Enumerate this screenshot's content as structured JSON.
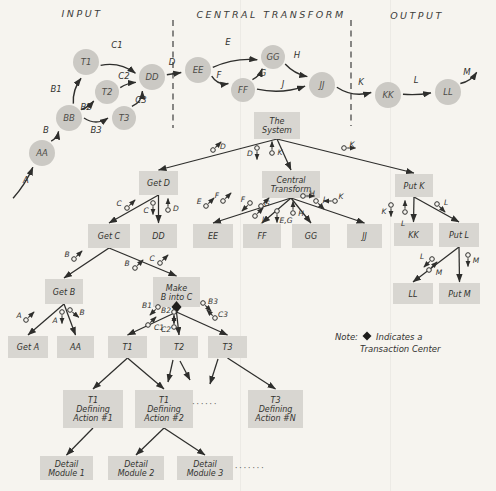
{
  "diagram": {
    "background_color": "#f6f4ef",
    "ink_color": "#2e2e2c",
    "node_fill": "#cbc9c4",
    "module_fill": "#d8d6d1",
    "sections": [
      {
        "label": "INPUT",
        "x": 82,
        "y": 17
      },
      {
        "label": "CENTRAL TRANSFORM",
        "x": 271,
        "y": 18
      },
      {
        "label": "OUTPUT",
        "x": 417,
        "y": 19
      }
    ],
    "dividers": [
      {
        "x": 173,
        "y1": 20,
        "y2": 128
      },
      {
        "x": 351,
        "y1": 20,
        "y2": 126
      }
    ],
    "folds": [
      {
        "x": 240.5
      },
      {
        "x": 390.5
      }
    ],
    "flow": {
      "nodes": [
        {
          "id": "AA",
          "label": "AA",
          "x": 42,
          "y": 153,
          "r": 13
        },
        {
          "id": "BB",
          "label": "BB",
          "x": 69,
          "y": 118,
          "r": 13
        },
        {
          "id": "T1",
          "label": "T1",
          "x": 86,
          "y": 62,
          "r": 13
        },
        {
          "id": "T2",
          "label": "T2",
          "x": 107,
          "y": 92,
          "r": 12
        },
        {
          "id": "T3",
          "label": "T3",
          "x": 124,
          "y": 118,
          "r": 12
        },
        {
          "id": "DD",
          "label": "DD",
          "x": 152,
          "y": 77,
          "r": 13
        },
        {
          "id": "EE",
          "label": "EE",
          "x": 198,
          "y": 70,
          "r": 13
        },
        {
          "id": "FF",
          "label": "FF",
          "x": 243,
          "y": 90,
          "r": 12
        },
        {
          "id": "GG",
          "label": "GG",
          "x": 273,
          "y": 57,
          "r": 12
        },
        {
          "id": "JJ",
          "label": "JJ",
          "x": 322,
          "y": 85,
          "r": 13
        },
        {
          "id": "KK",
          "label": "KK",
          "x": 388,
          "y": 95,
          "r": 13
        },
        {
          "id": "LL",
          "label": "LL",
          "x": 448,
          "y": 92,
          "r": 13
        }
      ],
      "edges": [
        {
          "x1": 12,
          "y1": 200,
          "to": "AA",
          "label": "A",
          "lx": 26,
          "ly": 183,
          "bend": 3
        },
        {
          "from": "AA",
          "to": "BB",
          "label": "B",
          "lx": 46,
          "ly": 133,
          "bend": 3
        },
        {
          "from": "BB",
          "to": "T1",
          "label": "B1",
          "lx": 56,
          "ly": 92,
          "bend": -5
        },
        {
          "from": "BB",
          "to": "T2",
          "label": "B2",
          "lx": 86,
          "ly": 110,
          "bend": 2
        },
        {
          "from": "BB",
          "to": "T3",
          "label": "B3",
          "lx": 96,
          "ly": 133,
          "bend": 8
        },
        {
          "from": "T1",
          "to": "DD",
          "label": "C1",
          "lx": 117,
          "ly": 48,
          "bend": -8
        },
        {
          "from": "T2",
          "to": "DD",
          "label": "C2",
          "lx": 124,
          "ly": 79,
          "bend": -2
        },
        {
          "from": "T3",
          "to": "DD",
          "label": "C3",
          "lx": 141,
          "ly": 103,
          "bend": 6
        },
        {
          "from": "DD",
          "to": "EE",
          "label": "D",
          "lx": 172,
          "ly": 65,
          "bend": 0
        },
        {
          "from": "EE",
          "to": "GG",
          "label": "E",
          "lx": 228,
          "ly": 45,
          "bend": -6
        },
        {
          "from": "EE",
          "to": "FF",
          "label": "F",
          "lx": 219,
          "ly": 78,
          "bend": 6
        },
        {
          "from": "FF",
          "to": "GG",
          "label": "G",
          "lx": 263,
          "ly": 76,
          "bend": 3
        },
        {
          "from": "GG",
          "to": "JJ",
          "label": "H",
          "lx": 297,
          "ly": 58,
          "bend": 4
        },
        {
          "from": "FF",
          "to": "JJ",
          "label": "J",
          "lx": 283,
          "ly": 87,
          "bend": 7
        },
        {
          "from": "JJ",
          "to": "KK",
          "label": "K",
          "lx": 361,
          "ly": 85,
          "bend": 8
        },
        {
          "from": "KK",
          "to": "LL",
          "label": "L",
          "lx": 416,
          "ly": 83,
          "bend": 2
        },
        {
          "from": "LL",
          "x2": 480,
          "y2": 70,
          "label": "M",
          "lx": 467,
          "ly": 75,
          "bend": 4
        }
      ]
    },
    "structure": {
      "modules": [
        {
          "id": "system",
          "label": [
            "The",
            "System"
          ],
          "x": 254,
          "y": 112,
          "w": 46,
          "h": 27
        },
        {
          "id": "getD",
          "label": [
            "Get D"
          ],
          "x": 139,
          "y": 171,
          "w": 39,
          "h": 24
        },
        {
          "id": "central",
          "label": [
            "Central",
            "Transform"
          ],
          "x": 262,
          "y": 171,
          "w": 58,
          "h": 27
        },
        {
          "id": "putK",
          "label": [
            "Put K"
          ],
          "x": 395,
          "y": 174,
          "w": 38,
          "h": 23
        },
        {
          "id": "getC",
          "label": [
            "Get C"
          ],
          "x": 88,
          "y": 224,
          "w": 42,
          "h": 24
        },
        {
          "id": "dd",
          "label": [
            "DD"
          ],
          "x": 140,
          "y": 224,
          "w": 37,
          "h": 24
        },
        {
          "id": "ee",
          "label": [
            "EE"
          ],
          "x": 193,
          "y": 224,
          "w": 40,
          "h": 24
        },
        {
          "id": "ff",
          "label": [
            "FF"
          ],
          "x": 243,
          "y": 224,
          "w": 38,
          "h": 24
        },
        {
          "id": "gg",
          "label": [
            "GG"
          ],
          "x": 292,
          "y": 224,
          "w": 38,
          "h": 24
        },
        {
          "id": "jj",
          "label": [
            "JJ"
          ],
          "x": 347,
          "y": 224,
          "w": 35,
          "h": 24
        },
        {
          "id": "kk",
          "label": [
            "KK"
          ],
          "x": 394,
          "y": 223,
          "w": 39,
          "h": 23
        },
        {
          "id": "putL",
          "label": [
            "Put L"
          ],
          "x": 439,
          "y": 223,
          "w": 40,
          "h": 24
        },
        {
          "id": "getB",
          "label": [
            "Get B"
          ],
          "x": 45,
          "y": 279,
          "w": 38,
          "h": 25
        },
        {
          "id": "make",
          "label": [
            "Make",
            "B into C"
          ],
          "x": 153,
          "y": 277,
          "w": 47,
          "h": 30,
          "diamond": true
        },
        {
          "id": "ll",
          "label": [
            "LL"
          ],
          "x": 393,
          "y": 283,
          "w": 40,
          "h": 21
        },
        {
          "id": "putM",
          "label": [
            "Put M"
          ],
          "x": 439,
          "y": 283,
          "w": 41,
          "h": 21
        },
        {
          "id": "getA",
          "label": [
            "Get A"
          ],
          "x": 8,
          "y": 336,
          "w": 40,
          "h": 22
        },
        {
          "id": "aa",
          "label": [
            "AA"
          ],
          "x": 57,
          "y": 336,
          "w": 37,
          "h": 22
        },
        {
          "id": "t1",
          "label": [
            "T1"
          ],
          "x": 108,
          "y": 336,
          "w": 39,
          "h": 22
        },
        {
          "id": "t2",
          "label": [
            "T2"
          ],
          "x": 160,
          "y": 336,
          "w": 38,
          "h": 22
        },
        {
          "id": "t3",
          "label": [
            "T3"
          ],
          "x": 208,
          "y": 336,
          "w": 39,
          "h": 22
        },
        {
          "id": "act1",
          "label": [
            "T1",
            "Defining",
            "Action #1"
          ],
          "x": 63,
          "y": 390,
          "w": 60,
          "h": 38
        },
        {
          "id": "act2",
          "label": [
            "T1",
            "Defining",
            "Action #2"
          ],
          "x": 135,
          "y": 390,
          "w": 58,
          "h": 38
        },
        {
          "id": "actN",
          "label": [
            "T3",
            "Defining",
            "Action #N"
          ],
          "x": 248,
          "y": 390,
          "w": 55,
          "h": 38
        },
        {
          "id": "det1",
          "label": [
            "Detail",
            "Module 1"
          ],
          "x": 40,
          "y": 456,
          "w": 53,
          "h": 24
        },
        {
          "id": "det2",
          "label": [
            "Detail",
            "Module 2"
          ],
          "x": 108,
          "y": 456,
          "w": 56,
          "h": 24
        },
        {
          "id": "det3",
          "label": [
            "Detail",
            "Module 3"
          ],
          "x": 177,
          "y": 456,
          "w": 56,
          "h": 24
        }
      ],
      "links": [
        {
          "from": "system",
          "to": "getD"
        },
        {
          "from": "system",
          "to": "central"
        },
        {
          "from": "system",
          "to": "putK"
        },
        {
          "from": "getD",
          "to": "getC"
        },
        {
          "from": "getD",
          "to": "dd"
        },
        {
          "from": "central",
          "to": "ee"
        },
        {
          "from": "central",
          "to": "ff"
        },
        {
          "from": "central",
          "to": "gg"
        },
        {
          "from": "central",
          "to": "jj"
        },
        {
          "from": "putK",
          "to": "kk"
        },
        {
          "from": "putK",
          "to": "putL"
        },
        {
          "from": "getC",
          "to": "getB"
        },
        {
          "from": "getC",
          "to": "make"
        },
        {
          "from": "getB",
          "to": "getA"
        },
        {
          "from": "getB",
          "to": "aa"
        },
        {
          "from": "make",
          "to": "t1"
        },
        {
          "from": "make",
          "to": "t2"
        },
        {
          "from": "make",
          "to": "t3"
        },
        {
          "from": "putL",
          "to": "ll"
        },
        {
          "from": "putL",
          "to": "putM"
        },
        {
          "from": "t1",
          "to": "act1"
        },
        {
          "from": "t1",
          "to": "act2"
        },
        {
          "from": "t3",
          "to": "actN"
        },
        {
          "from": "act1",
          "to": "det1"
        },
        {
          "from": "act2",
          "to": "det2"
        },
        {
          "from": "act2",
          "to": "det3"
        }
      ],
      "stubs": [
        {
          "x1": 173,
          "y1": 360,
          "x2": 168,
          "y2": 382
        },
        {
          "x1": 180,
          "y1": 361,
          "x2": 190,
          "y2": 380
        },
        {
          "x1": 218,
          "y1": 359,
          "x2": 210,
          "y2": 384
        }
      ],
      "couples": [
        {
          "l": "D",
          "cx": 213,
          "cy": 150,
          "a": 315,
          "lx": 223,
          "ly": 146
        },
        {
          "l": "D",
          "cx": 257,
          "cy": 148,
          "a": 90,
          "lx": 250,
          "ly": 153
        },
        {
          "l": "K",
          "cx": 272,
          "cy": 153,
          "a": 270,
          "lx": 280,
          "ly": 152
        },
        {
          "l": "K",
          "cx": 344,
          "cy": 148,
          "a": 0,
          "lx": 352,
          "ly": 144
        },
        {
          "l": "C",
          "cx": 127,
          "cy": 208,
          "a": 315,
          "lx": 119,
          "ly": 203
        },
        {
          "l": "C",
          "cx": 153,
          "cy": 203,
          "a": 90,
          "lx": 146,
          "ly": 210
        },
        {
          "l": "D",
          "cx": 168,
          "cy": 210,
          "a": 270,
          "lx": 176,
          "ly": 208
        },
        {
          "l": "E",
          "cx": 206,
          "cy": 206,
          "a": 315,
          "lx": 199,
          "ly": 201
        },
        {
          "l": "F",
          "cx": 223,
          "cy": 201,
          "a": 315,
          "lx": 217,
          "ly": 195
        },
        {
          "l": "F",
          "cx": 250,
          "cy": 203,
          "a": 135,
          "lx": 243,
          "ly": 199
        },
        {
          "l": "G",
          "cx": 261,
          "cy": 206,
          "a": 315,
          "lx": 267,
          "ly": 203
        },
        {
          "l": "J",
          "cx": 255,
          "cy": 216,
          "a": 315,
          "lx": 263,
          "ly": 219
        },
        {
          "l": "E,G",
          "cx": 277,
          "cy": 211,
          "a": 90,
          "lx": 286,
          "ly": 220
        },
        {
          "l": "H",
          "cx": 293,
          "cy": 213,
          "a": 270,
          "lx": 301,
          "ly": 213
        },
        {
          "l": "H",
          "cx": 303,
          "cy": 196,
          "a": 0,
          "lx": 312,
          "ly": 193
        },
        {
          "l": "J",
          "cx": 316,
          "cy": 201,
          "a": 45,
          "lx": 324,
          "ly": 199
        },
        {
          "l": "K",
          "cx": 335,
          "cy": 201,
          "a": 180,
          "lx": 341,
          "ly": 196
        },
        {
          "l": "K",
          "cx": 391,
          "cy": 205,
          "a": 90,
          "lx": 384,
          "ly": 211
        },
        {
          "l": "L",
          "cx": 405,
          "cy": 212,
          "a": 270,
          "lx": 403,
          "ly": 223
        },
        {
          "l": "L",
          "cx": 437,
          "cy": 204,
          "a": 45,
          "lx": 446,
          "ly": 202
        },
        {
          "l": "B",
          "cx": 74,
          "cy": 259,
          "a": 315,
          "lx": 67,
          "ly": 254
        },
        {
          "l": "B",
          "cx": 135,
          "cy": 268,
          "a": 315,
          "lx": 127,
          "ly": 263
        },
        {
          "l": "C",
          "cx": 160,
          "cy": 263,
          "a": 315,
          "lx": 152,
          "ly": 258
        },
        {
          "l": "A",
          "cx": 26,
          "cy": 320,
          "a": 315,
          "lx": 19,
          "ly": 315
        },
        {
          "l": "A",
          "cx": 62,
          "cy": 312,
          "a": 90,
          "lx": 55,
          "ly": 320
        },
        {
          "l": "B",
          "cx": 70,
          "cy": 310,
          "a": 40,
          "lx": 82,
          "ly": 312
        },
        {
          "l": "B1",
          "cx": 158,
          "cy": 307,
          "a": 135,
          "lx": 147,
          "ly": 305
        },
        {
          "l": "C1",
          "cx": 148,
          "cy": 325,
          "a": 315,
          "lx": 159,
          "ly": 327
        },
        {
          "l": "B2",
          "cx": 174,
          "cy": 312,
          "a": 90,
          "lx": 166,
          "ly": 310
        },
        {
          "l": "C2",
          "cx": 174,
          "cy": 327,
          "a": 270,
          "lx": 166,
          "ly": 329
        },
        {
          "l": "B3",
          "cx": 203,
          "cy": 303,
          "a": 45,
          "lx": 213,
          "ly": 301
        },
        {
          "l": "C3",
          "cx": 215,
          "cy": 318,
          "a": 225,
          "lx": 223,
          "ly": 314
        },
        {
          "l": "L",
          "cx": 432,
          "cy": 259,
          "a": 135,
          "lx": 422,
          "ly": 256
        },
        {
          "l": "M",
          "cx": 429,
          "cy": 270,
          "a": 315,
          "lx": 439,
          "ly": 272
        },
        {
          "l": "M",
          "cx": 468,
          "cy": 255,
          "a": 90,
          "lx": 476,
          "ly": 260
        }
      ],
      "dots": [
        {
          "x": 205,
          "y": 407,
          "text": "······"
        },
        {
          "x": 250,
          "y": 471,
          "text": "·······"
        }
      ]
    },
    "note": {
      "prefix": "Note:",
      "x": 335,
      "y": 340,
      "diamond_x": 367,
      "diamond_y": 336,
      "line1": "Indicates a",
      "line1_x": 376,
      "line1_y": 340,
      "line2": "Transaction Center",
      "line2_x": 360,
      "line2_y": 352
    }
  }
}
